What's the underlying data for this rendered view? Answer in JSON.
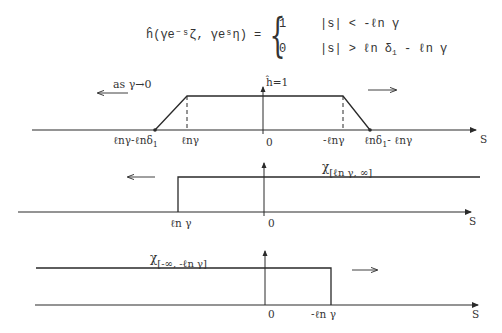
{
  "formula": {
    "lhs": "ĥ(γe⁻ˢζ, γeˢη) =",
    "brace": "{",
    "cases": [
      {
        "value": "1",
        "condition": "|s| < -ℓn γ"
      },
      {
        "value": "0",
        "condition_main": "|s| > ℓn δ",
        "condition_sub": "1",
        "condition_tail": " - ℓn γ"
      }
    ]
  },
  "panel1": {
    "motion_label": "as γ→0",
    "height_label": "ĥ=1",
    "axis_label": "S",
    "ticks": {
      "left_foot": "ℓnγ-ℓnδ",
      "left_foot_sub": "1",
      "left_top": "ℓnγ",
      "zero": "0",
      "right_top": "-ℓnγ",
      "right_foot_main": "ℓnδ",
      "right_foot_sub": "1",
      "right_foot_tail": "- ℓnγ"
    }
  },
  "panel2": {
    "function_label": "χ",
    "function_sub": "[ℓn γ, ∞]",
    "axis_label": "S",
    "ticks": {
      "step": "ℓn γ",
      "zero": "0"
    }
  },
  "panel3": {
    "function_label": "χ",
    "function_sub": "[-∞, -ℓn γ]",
    "axis_label": "S",
    "ticks": {
      "zero": "0",
      "step": "-ℓn γ"
    }
  },
  "colors": {
    "ink": "#2a2a2a",
    "background": "#ffffff"
  }
}
